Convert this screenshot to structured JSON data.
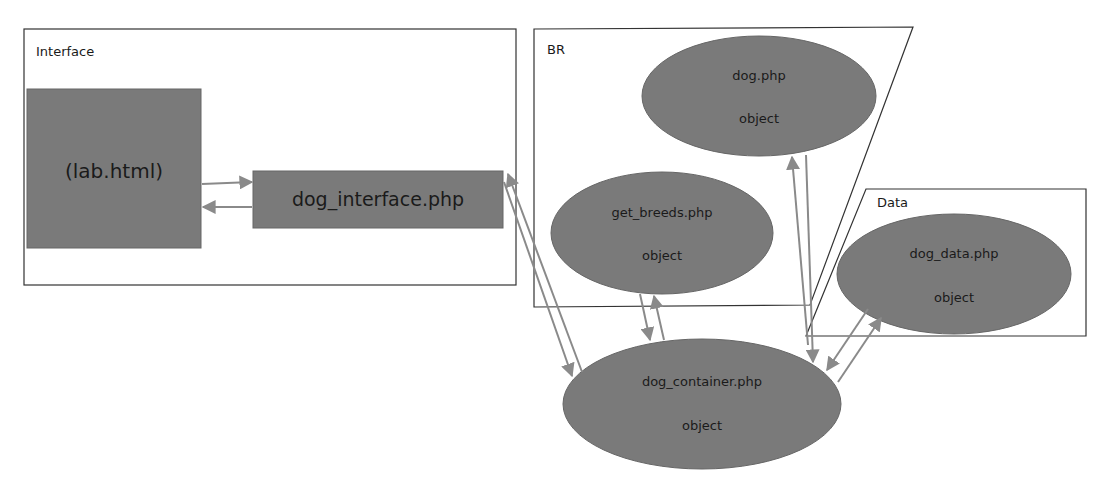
{
  "regions": {
    "interface": {
      "label": "Interface"
    },
    "br": {
      "label": "BR"
    },
    "data": {
      "label": "Data"
    }
  },
  "nodes": {
    "lab_html": {
      "label": "(lab.html)"
    },
    "dog_interface": {
      "label": "dog_interface.php"
    },
    "dog": {
      "label": "dog.php",
      "sublabel": "object"
    },
    "get_breeds": {
      "label": "get_breeds.php",
      "sublabel": "object"
    },
    "dog_data": {
      "label": "dog_data.php",
      "sublabel": "object"
    },
    "dog_container": {
      "label": "dog_container.php",
      "sublabel": "object"
    }
  },
  "edges": [
    {
      "from": "lab_html",
      "to": "dog_interface"
    },
    {
      "from": "dog_interface",
      "to": "lab_html"
    },
    {
      "from": "dog_interface",
      "to": "dog_container"
    },
    {
      "from": "dog_container",
      "to": "dog_interface"
    },
    {
      "from": "get_breeds",
      "to": "dog_container"
    },
    {
      "from": "dog_container",
      "to": "get_breeds"
    },
    {
      "from": "dog",
      "to": "dog_container"
    },
    {
      "from": "dog_container",
      "to": "dog"
    },
    {
      "from": "dog_data",
      "to": "dog_container"
    },
    {
      "from": "dog_container",
      "to": "dog_data"
    }
  ],
  "colors": {
    "node_fill": "#7a7a7a",
    "node_stroke": "#666666",
    "arrow": "#8a8a8a",
    "region_stroke": "#333333"
  }
}
